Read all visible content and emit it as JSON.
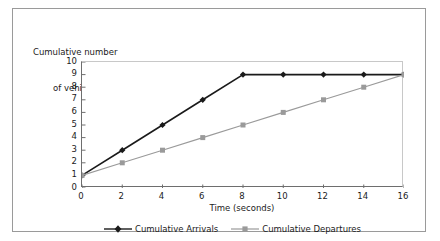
{
  "chart_data": {
    "type": "line",
    "title": "",
    "xlabel": "Time (seconds)",
    "ylabel": "Cumulative number of vehicles",
    "ylabel_line1": "Cumulative number",
    "ylabel_line2": "of vehicles",
    "x": [
      0,
      2,
      4,
      6,
      8,
      10,
      12,
      14,
      16
    ],
    "xticklabels": [
      "0",
      "2",
      "4",
      "6",
      "8",
      "10",
      "12",
      "14",
      "16"
    ],
    "yticklabels": [
      "0",
      "1",
      "2",
      "3",
      "4",
      "5",
      "6",
      "7",
      "8",
      "9",
      "10"
    ],
    "xlim": [
      0,
      16
    ],
    "ylim": [
      0,
      10
    ],
    "grid": false,
    "legend_position": "bottom",
    "series": [
      {
        "name": "Cumulative Arrivals",
        "values": [
          1,
          3,
          5,
          7,
          9,
          9,
          9,
          9,
          9
        ],
        "color": "#1a1a1a",
        "marker": "diamond"
      },
      {
        "name": "Cumulative Departures",
        "values": [
          1,
          2,
          3,
          4,
          5,
          6,
          7,
          8,
          9
        ],
        "color": "#9a9a9a",
        "marker": "square"
      }
    ]
  },
  "legend": {
    "arrivals_label": "Cumulative Arrivals",
    "departures_label": "Cumulative Departures"
  },
  "colors": {
    "arrivals": "#1a1a1a",
    "departures": "#9a9a9a",
    "frame_border": "#9a9a9a",
    "axis": "#6e6e6e",
    "plot_border": "#c8c8c8",
    "background": "#ffffff",
    "text": "#1b1b1b"
  }
}
